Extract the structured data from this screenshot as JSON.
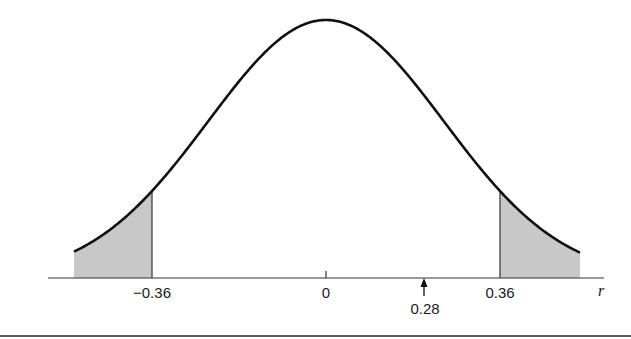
{
  "chart_data": {
    "type": "area",
    "title": "",
    "xlabel": "r",
    "ylabel": "",
    "distribution": "normal (sampling distribution of r)",
    "mean": 0,
    "critical_values": [
      -0.36,
      0.36
    ],
    "observed_value": 0.28,
    "shaded_regions": [
      {
        "from": "-inf",
        "to": -0.36,
        "label": "lower rejection region"
      },
      {
        "from": 0.36,
        "to": "inf",
        "label": "upper rejection region"
      }
    ],
    "tick_labels": [
      "-0.36",
      "0",
      "0.36"
    ],
    "annotation": {
      "label": "0.28",
      "marker": "up-arrow"
    },
    "grid": false,
    "legend": null
  },
  "labels": {
    "tick_neg": "−0.36",
    "tick_zero": "0",
    "tick_pos": "0.36",
    "observed": "0.28",
    "axis_var": "r"
  },
  "colors": {
    "curve": "#111111",
    "shade": "#c8c8c8",
    "axis": "#333333"
  }
}
